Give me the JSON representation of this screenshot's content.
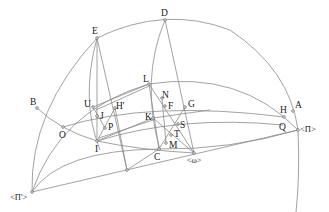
{
  "diagram": {
    "type": "spherical-geometry-construction",
    "labels": {
      "E": "E",
      "D": "D",
      "L": "L",
      "B": "B",
      "A": "A",
      "U": "U",
      "J": "J",
      "Hp": "H'",
      "P": "P",
      "O": "O",
      "I": "I",
      "N": "N",
      "F": "F",
      "G": "G",
      "K": "K",
      "S": "S",
      "T": "T",
      "M": "M",
      "C": "C",
      "omega": "<ω>",
      "H": "H",
      "Q": "Q",
      "Pi": "<Π>",
      "Pip": "<Π'>"
    },
    "line_color": "#8a8a8a",
    "text_color": "#222222"
  }
}
